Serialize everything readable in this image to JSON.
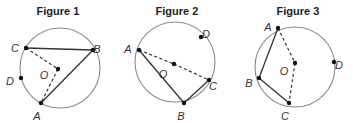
{
  "figures": [
    {
      "title": "Figure 1",
      "circle": {
        "cx": 60,
        "cy": 68,
        "r": 40
      },
      "points": {
        "A": {
          "x": 41,
          "y": 103,
          "label": "A",
          "lx": 37,
          "ly": 117
        },
        "B": {
          "x": 93,
          "y": 50,
          "label": "B",
          "lx": 97,
          "ly": 50
        },
        "C": {
          "x": 26,
          "y": 48,
          "label": "C",
          "lx": 15,
          "ly": 49
        },
        "D": {
          "x": 21,
          "y": 78,
          "label": "D",
          "lx": 10,
          "ly": 82
        },
        "O": {
          "x": 58,
          "y": 69,
          "label": "O",
          "lx": 44,
          "ly": 76
        }
      },
      "solid_segments": [
        [
          "C",
          "B"
        ],
        [
          "B",
          "A"
        ]
      ],
      "dashed_segments": [
        [
          "C",
          "O"
        ],
        [
          "O",
          "A"
        ]
      ]
    },
    {
      "title": "Figure 2",
      "circle": {
        "cx": 175,
        "cy": 62,
        "r": 40
      },
      "points": {
        "A": {
          "x": 139,
          "y": 50,
          "label": "A",
          "lx": 128,
          "ly": 50
        },
        "B": {
          "x": 184,
          "y": 103,
          "label": "B",
          "lx": 181,
          "ly": 117
        },
        "C": {
          "x": 209,
          "y": 80,
          "label": "C",
          "lx": 213,
          "ly": 87
        },
        "D": {
          "x": 201,
          "y": 37,
          "label": "D",
          "lx": 206,
          "ly": 35
        },
        "O": {
          "x": 174,
          "y": 64,
          "label": "O",
          "lx": 163,
          "ly": 75
        }
      },
      "solid_segments": [
        [
          "A",
          "B"
        ],
        [
          "B",
          "C"
        ]
      ],
      "dashed_segments": [
        [
          "A",
          "O"
        ],
        [
          "O",
          "C"
        ]
      ]
    },
    {
      "title": "Figure 3",
      "circle": {
        "cx": 295,
        "cy": 67,
        "r": 40
      },
      "points": {
        "A": {
          "x": 278,
          "y": 28,
          "label": "A",
          "lx": 268,
          "ly": 28
        },
        "B": {
          "x": 259,
          "y": 78,
          "label": "B",
          "lx": 249,
          "ly": 84
        },
        "C": {
          "x": 289,
          "y": 103,
          "label": "C",
          "lx": 285,
          "ly": 117
        },
        "D": {
          "x": 334,
          "y": 62,
          "label": "D",
          "lx": 339,
          "ly": 66
        },
        "O": {
          "x": 295,
          "y": 63,
          "label": "O",
          "lx": 284,
          "ly": 72
        }
      },
      "solid_segments": [
        [
          "A",
          "B"
        ],
        [
          "B",
          "C"
        ]
      ],
      "dashed_segments": [
        [
          "A",
          "O"
        ],
        [
          "O",
          "C"
        ]
      ]
    }
  ],
  "title_positions": [
    {
      "x": 58,
      "y": 15
    },
    {
      "x": 177,
      "y": 15
    },
    {
      "x": 298,
      "y": 15
    }
  ]
}
